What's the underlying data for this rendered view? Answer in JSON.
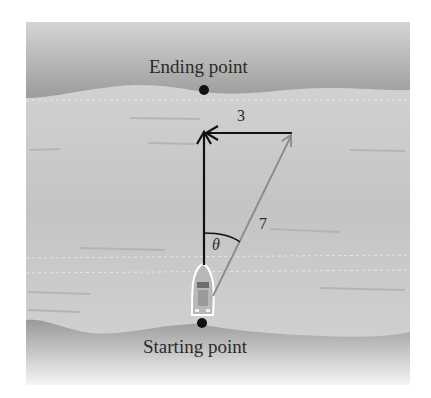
{
  "diagram": {
    "labels": {
      "ending_point": "Ending point",
      "starting_point": "Starting point",
      "horizontal_vector": "3",
      "resultant_vector": "7",
      "angle": "θ"
    },
    "colors": {
      "bank": "#9a9a9a",
      "water": "#c9c9c9",
      "vector_black": "#111111",
      "vector_gray": "#8a8a8a"
    }
  }
}
